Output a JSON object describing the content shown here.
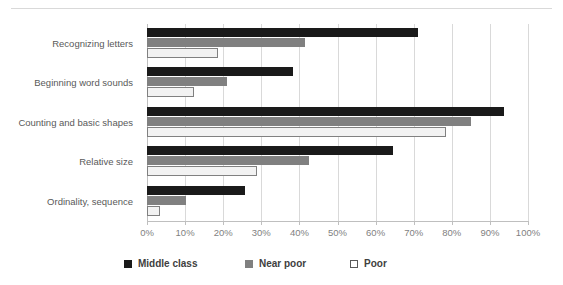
{
  "chart_data": {
    "type": "bar",
    "orientation": "horizontal",
    "title": "",
    "xlabel": "",
    "ylabel": "",
    "xlim": [
      0,
      100
    ],
    "xtick_labels": [
      "0%",
      "10%",
      "20%",
      "30%",
      "40%",
      "50%",
      "60%",
      "70%",
      "80%",
      "90%",
      "100%"
    ],
    "xtick_values": [
      0,
      10,
      20,
      30,
      40,
      50,
      60,
      70,
      80,
      90,
      100
    ],
    "grid": true,
    "legend_position": "bottom",
    "categories": [
      "Recognizing letters",
      "Beginning word sounds",
      "Counting and basic shapes",
      "Relative size",
      "Ordinality, sequence"
    ],
    "series": [
      {
        "name": "Middle class",
        "color": "#1a1a1a",
        "values": [
          71,
          38.3,
          93.7,
          64.5,
          25.7
        ]
      },
      {
        "name": "Near poor",
        "color": "#808080",
        "values": [
          41.5,
          21,
          85,
          42.5,
          10.2
        ]
      },
      {
        "name": "Poor",
        "color": "#f2f2f2",
        "values": [
          18.6,
          12.4,
          78.5,
          28.8,
          3.5
        ]
      }
    ]
  },
  "legend": {
    "items": [
      {
        "label": "Middle class",
        "swatch": "swatch-black"
      },
      {
        "label": "Near poor",
        "swatch": "swatch-gray"
      },
      {
        "label": "Poor",
        "swatch": "swatch-white"
      }
    ]
  }
}
